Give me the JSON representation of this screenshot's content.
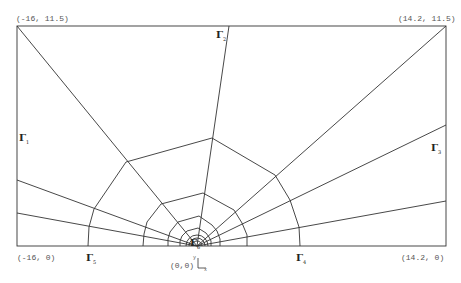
{
  "diagram": {
    "type": "finite-element-mesh",
    "colors": {
      "line": "#333333",
      "label": "#555555",
      "background": "#ffffff"
    },
    "corner_labels": {
      "top_left": "(-16, 11.5)",
      "top_right": "(14.2, 11.5)",
      "bottom_left": "(-16, 0)",
      "bottom_right": "(14.2, 0)",
      "origin": "(0,0)"
    },
    "axes": {
      "y": "y",
      "x": "x"
    },
    "boundaries": [
      {
        "symbol": "Γ",
        "subscript": "1",
        "position": "left-edge"
      },
      {
        "symbol": "Γ",
        "subscript": "2",
        "position": "top-edge"
      },
      {
        "symbol": "Γ",
        "subscript": "3",
        "position": "right-edge"
      },
      {
        "symbol": "Γ",
        "subscript": "4",
        "position": "bottom-right"
      },
      {
        "symbol": "Γ",
        "subscript": "5",
        "position": "bottom-left"
      },
      {
        "symbol": "Γ",
        "subscript": "6",
        "position": "crack-tip"
      }
    ]
  }
}
